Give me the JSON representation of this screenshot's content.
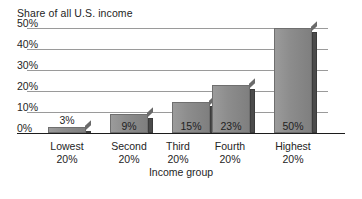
{
  "chart_data": {
    "type": "bar",
    "title": "",
    "ylabel": "Share of all U.S. income",
    "xlabel": "Income group",
    "categories": [
      "Lowest 20%",
      "Second 20%",
      "Third 20%",
      "Fourth 20%",
      "Highest 20%"
    ],
    "category_lines": [
      [
        "Lowest",
        "20%"
      ],
      [
        "Second",
        "20%"
      ],
      [
        "Third",
        "20%"
      ],
      [
        "Fourth",
        "20%"
      ],
      [
        "Highest",
        "20%"
      ]
    ],
    "values": [
      3,
      9,
      15,
      23,
      50
    ],
    "value_labels": [
      "3%",
      "9%",
      "15%",
      "23%",
      "50%"
    ],
    "ylim": [
      0,
      50
    ],
    "yticks": [
      0,
      10,
      20,
      30,
      40,
      50
    ],
    "ytick_labels": [
      "0%",
      "10%",
      "20%",
      "30%",
      "40%",
      "50%"
    ],
    "grid": true,
    "legend": "none",
    "bar_color": "#8d8d8d",
    "bar_side_color": "#4b4b4b",
    "gridline_color": "#9a9a9a",
    "axis_color": "#1c1c1c"
  }
}
